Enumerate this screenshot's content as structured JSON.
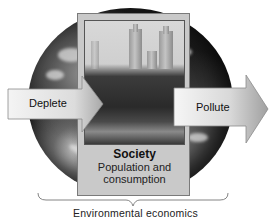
{
  "diagram": {
    "center": {
      "title": "Society",
      "subtitle_line1": "Population and",
      "subtitle_line2": "consumption",
      "photo": "city-skyline-with-park-photo"
    },
    "left_arrow": {
      "label": "Deplete",
      "direction": "right"
    },
    "right_arrow": {
      "label": "Pollute",
      "direction": "right"
    },
    "background": "earth-globe",
    "brace_label": "Environmental economics"
  },
  "colors": {
    "arrow_fill_light": "#f2f2f2",
    "arrow_fill_dark": "#b5b5b5",
    "box_fill": "#c9c9c9",
    "text": "#111111"
  }
}
